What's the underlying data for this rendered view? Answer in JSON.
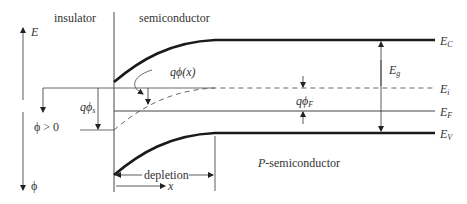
{
  "regions": {
    "insulator": "insulator",
    "semiconductor": "semiconductor",
    "p_semiconductor": "P-semiconductor"
  },
  "axes": {
    "energy": "E",
    "potential": "ϕ",
    "potential_condition": "ϕ > 0",
    "position": "x"
  },
  "bands": {
    "conduction": {
      "symbol": "E",
      "sub": "C"
    },
    "intrinsic": {
      "symbol": "E",
      "sub": "i"
    },
    "fermi": {
      "symbol": "E",
      "sub": "F"
    },
    "valence": {
      "symbol": "E",
      "sub": "V"
    },
    "gap": {
      "symbol": "E",
      "sub": "g"
    }
  },
  "annotations": {
    "q_phi_x": "qϕ(x)",
    "q_phi_s": {
      "main": "qϕ",
      "sub": "s"
    },
    "q_phi_F": {
      "main": "qϕ",
      "sub": "F"
    },
    "depletion": "depletion"
  },
  "colors": {
    "line": "#1a1a1a",
    "thin_line": "#444444",
    "dashed": "#666666"
  }
}
